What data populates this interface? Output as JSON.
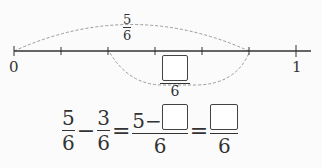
{
  "number_line": {
    "start_label": "0",
    "end_label": "1",
    "divisions": 6,
    "ticks_x": [
      14,
      61,
      108,
      155,
      202,
      249,
      296
    ]
  },
  "top_arc": {
    "from": "0",
    "to": "5/6",
    "label": {
      "numerator": "5",
      "denominator": "6"
    }
  },
  "bottom_arc": {
    "from": "2/6",
    "to": "5/6",
    "label": {
      "numerator": "",
      "denominator": "6",
      "numerator_is_blank_box": true
    }
  },
  "equation": {
    "term1": {
      "numerator": "5",
      "denominator": "6"
    },
    "minus": "−",
    "term2": {
      "numerator": "3",
      "denominator": "6"
    },
    "equals1": "=",
    "term3": {
      "numerator_prefix": "5−",
      "numerator_blank": true,
      "denominator": "6"
    },
    "equals2": "=",
    "term4": {
      "numerator_blank": true,
      "denominator": "6"
    }
  },
  "colors": {
    "line": "#333333",
    "arc": "#9a9a9a",
    "background": "#fbfbfb"
  }
}
